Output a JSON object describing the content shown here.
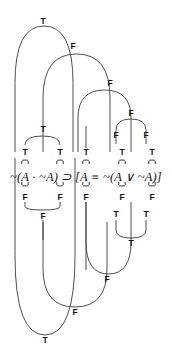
{
  "diagram": {
    "formula": "~(A · ~A) ⊃ [A ≡ ~(A ∨ ~A)]",
    "formula_parts": {
      "left_negation": "~",
      "left_open_paren": "(",
      "a1": "A",
      "dot": "·",
      "neg2": "~",
      "a2": "A",
      "left_close_paren": ")",
      "horseshoe": "⊃",
      "open_bracket": "[",
      "a3": "A",
      "triple_bar": "≡",
      "neg3": "~",
      "inner_open_paren": "(",
      "a4": "A",
      "wedge": "∨",
      "neg4": "~",
      "a5": "A",
      "inner_close_paren": ")",
      "close_bracket": "]"
    },
    "stroke_color": "#3a3a3a",
    "text_color": "#111111",
    "background": "#ffffff",
    "truth_values": [
      {
        "id": "tv-top-main",
        "label": "T",
        "x": 43,
        "y": 21
      },
      {
        "id": "tv-l2-f",
        "label": "F",
        "x": 73,
        "y": 46
      },
      {
        "id": "tv-l3-f",
        "label": "F",
        "x": 110,
        "y": 83
      },
      {
        "id": "tv-l4-f",
        "label": "F",
        "x": 131,
        "y": 113
      },
      {
        "id": "tv-upper-dot",
        "label": "T",
        "x": 43,
        "y": 129
      },
      {
        "id": "tv-row-t-1",
        "label": "T",
        "x": 25,
        "y": 152
      },
      {
        "id": "tv-row-t-2",
        "label": "T",
        "x": 60,
        "y": 152
      },
      {
        "id": "tv-row-t-3",
        "label": "T",
        "x": 86,
        "y": 152
      },
      {
        "id": "tv-row-t-4",
        "label": "T",
        "x": 122,
        "y": 152
      },
      {
        "id": "tv-row-t-5",
        "label": "T",
        "x": 152,
        "y": 152
      },
      {
        "id": "tv-upper-f-4",
        "label": "F",
        "x": 116,
        "y": 135
      },
      {
        "id": "tv-upper-f-5",
        "label": "F",
        "x": 146,
        "y": 135
      },
      {
        "id": "tv-row-f-1",
        "label": "F",
        "x": 25,
        "y": 197
      },
      {
        "id": "tv-row-f-2",
        "label": "F",
        "x": 60,
        "y": 197
      },
      {
        "id": "tv-row-f-3",
        "label": "F",
        "x": 86,
        "y": 197
      },
      {
        "id": "tv-row-f-4",
        "label": "F",
        "x": 122,
        "y": 197
      },
      {
        "id": "tv-row-f-5",
        "label": "F",
        "x": 152,
        "y": 197
      },
      {
        "id": "tv-lower-f-12",
        "label": "F",
        "x": 43,
        "y": 216
      },
      {
        "id": "tv-lower-t-4",
        "label": "T",
        "x": 116,
        "y": 214
      },
      {
        "id": "tv-lower-t-5",
        "label": "T",
        "x": 146,
        "y": 214
      },
      {
        "id": "tv-lower-t-45",
        "label": "T",
        "x": 131,
        "y": 243
      },
      {
        "id": "tv-lower-f-345",
        "label": "F",
        "x": 107,
        "y": 279
      },
      {
        "id": "tv-lower-f-big",
        "label": "F",
        "x": 75,
        "y": 312
      },
      {
        "id": "tv-bottom-t",
        "label": "T",
        "x": 45,
        "y": 340
      }
    ],
    "arcs_top": [
      {
        "id": "arc-top-main",
        "from_x": 15,
        "to_x": 73,
        "apex_y": 26,
        "base_y": 152
      },
      {
        "id": "arc-top-l2",
        "from_x": 43,
        "to_x": 110,
        "apex_y": 54,
        "base_y": 152
      },
      {
        "id": "arc-top-l3",
        "from_x": 78,
        "to_x": 131,
        "apex_y": 90,
        "base_y": 152
      },
      {
        "id": "arc-top-l4",
        "from_x": 116,
        "to_x": 146,
        "apex_y": 119,
        "base_y": 144
      }
    ],
    "arcs_bottom": [
      {
        "id": "arc-bot-dot",
        "from_x": 25,
        "to_x": 60,
        "apex_y": 210,
        "base_y": 202
      },
      {
        "id": "arc-bot-l45",
        "from_x": 116,
        "to_x": 146,
        "apex_y": 238,
        "base_y": 220
      },
      {
        "id": "arc-bot-l345",
        "from_x": 86,
        "to_x": 131,
        "apex_y": 274,
        "base_y": 202
      },
      {
        "id": "arc-bot-big",
        "from_x": 43,
        "to_x": 107,
        "apex_y": 307,
        "base_y": 222
      },
      {
        "id": "arc-bot-final",
        "from_x": 15,
        "to_x": 75,
        "apex_y": 335,
        "base_y": 158
      }
    ],
    "small_brackets_top": [
      {
        "id": "bracket-top-1",
        "x": 25,
        "y": 160
      },
      {
        "id": "bracket-top-2",
        "x": 60,
        "y": 160
      },
      {
        "id": "bracket-top-3",
        "x": 86,
        "y": 160
      },
      {
        "id": "bracket-top-4",
        "x": 122,
        "y": 160
      },
      {
        "id": "bracket-top-5",
        "x": 152,
        "y": 160
      }
    ],
    "small_brackets_bottom": [
      {
        "id": "bracket-bot-1",
        "x": 25,
        "y": 186
      },
      {
        "id": "bracket-bot-2",
        "x": 60,
        "y": 186
      },
      {
        "id": "bracket-bot-3",
        "x": 86,
        "y": 186
      },
      {
        "id": "bracket-bot-4",
        "x": 122,
        "y": 186
      },
      {
        "id": "bracket-bot-5",
        "x": 152,
        "y": 186
      }
    ],
    "connector_arc_small": [
      {
        "id": "conn-upper-dot",
        "from_x": 25,
        "to_x": 60,
        "apex_y": 136
      }
    ],
    "vertical_stubs": [
      {
        "id": "stub-upper-3",
        "x": 86,
        "y1": 126,
        "y2": 148
      },
      {
        "id": "stub-lower-3",
        "x": 86,
        "y1": 202,
        "y2": 270
      },
      {
        "id": "stub-f12-down",
        "x": 43,
        "y1": 220,
        "y2": 240
      }
    ]
  }
}
